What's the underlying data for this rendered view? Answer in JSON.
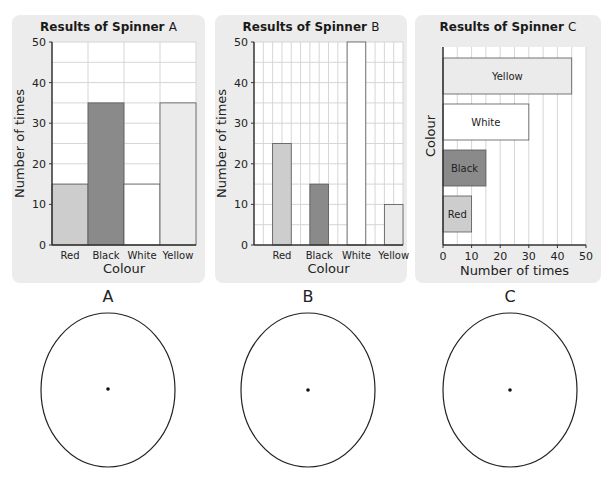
{
  "colors": {
    "red": "#cdcdcd",
    "black": "#8a8a8a",
    "white": "#ffffff",
    "yellow": "#ebebeb",
    "panel_bg": "#ececec",
    "grid": "#d6d6d6",
    "axis": "#333333"
  },
  "chart_data": [
    {
      "type": "bar",
      "title": "Results of Spinner A",
      "title_main": "Results of Spinner",
      "title_letter": "A",
      "categories": [
        "Red",
        "Black",
        "White",
        "Yellow"
      ],
      "values": [
        15,
        35,
        15,
        35
      ],
      "xlabel": "Colour",
      "ylabel": "Number of times",
      "ylim": [
        0,
        50
      ],
      "yticks": [
        "0",
        "10",
        "20",
        "30",
        "40",
        "50"
      ],
      "grid": true,
      "orientation": "vertical"
    },
    {
      "type": "bar",
      "title": "Results of Spinner B",
      "title_main": "Results of Spinner",
      "title_letter": "B",
      "categories": [
        "Red",
        "Black",
        "White",
        "Yellow"
      ],
      "values": [
        25,
        15,
        50,
        10
      ],
      "xlabel": "Colour",
      "ylabel": "Number of times",
      "ylim": [
        0,
        50
      ],
      "yticks": [
        "0",
        "10",
        "20",
        "30",
        "40",
        "50"
      ],
      "grid": true,
      "orientation": "vertical"
    },
    {
      "type": "bar",
      "title": "Results of Spinner C",
      "title_main": "Results of Spinner",
      "title_letter": "C",
      "categories": [
        "Yellow",
        "White",
        "Black",
        "Red"
      ],
      "values": [
        45,
        30,
        15,
        10
      ],
      "xlabel": "Number of times",
      "ylabel": "Colour",
      "xlim": [
        0,
        50
      ],
      "xticks": [
        "0",
        "10",
        "20",
        "30",
        "40",
        "50"
      ],
      "grid": true,
      "orientation": "horizontal"
    }
  ],
  "spinners": [
    {
      "label": "A"
    },
    {
      "label": "B"
    },
    {
      "label": "C"
    }
  ]
}
